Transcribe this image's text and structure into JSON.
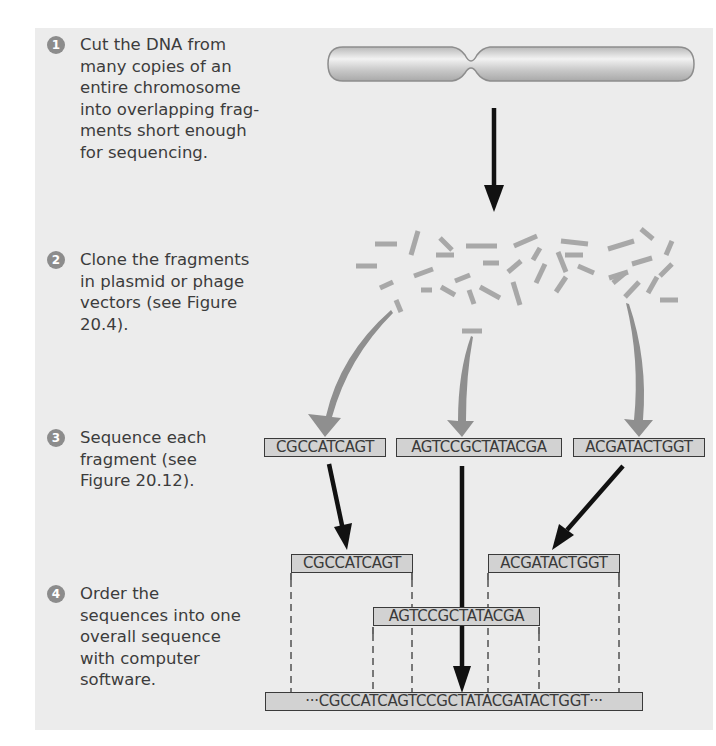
{
  "figure": {
    "steps": [
      {
        "number": "1",
        "text": "Cut the DNA from\nmany copies of an\nentire chromosome\ninto overlapping frag-\nments short enough\nfor sequencing."
      },
      {
        "number": "2",
        "text": "Clone the fragments\nin plasmid or phage\nvectors (see Figure\n20.4)."
      },
      {
        "number": "3",
        "text": "Sequence each\nfragment (see\nFigure 20.12)."
      },
      {
        "number": "4",
        "text": "Order the\nsequences into one\noverall sequence\nwith computer\nsoftware."
      }
    ],
    "sequenced_fragments": [
      "CGCCATCAGT",
      "AGTCCGCTATACGA",
      "ACGATACTGGT"
    ],
    "ordered_fragments": {
      "left": "CGCCATCAGT",
      "middle": "AGTCCGCTATACGA",
      "right": "ACGATACTGGT"
    },
    "overall_sequence": "···CGCCATCAGTCCGCTATACGATACTGGT···",
    "colors": {
      "panel_bg": "#ececec",
      "badge": "#8c8c8c",
      "fragment": "#a8a8a8",
      "wedge_arrow": "#8f8f8f",
      "arrow": "#1a1a1a",
      "seq_box_fill": "#d2d2d2"
    }
  }
}
